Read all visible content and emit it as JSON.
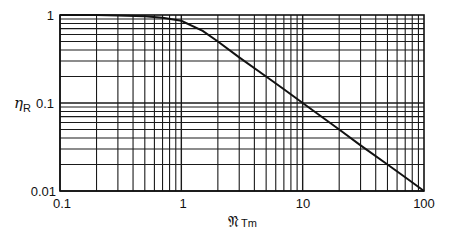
{
  "chart_data": {
    "type": "line",
    "title": "",
    "xlabel": "𝔑 Tm",
    "xlabel_main": "𝔑",
    "xlabel_sub": "Tm",
    "ylabel": "η R",
    "ylabel_main": "η",
    "ylabel_sub": "R",
    "xscale": "log",
    "yscale": "log",
    "xlim": [
      0.1,
      100
    ],
    "ylim": [
      0.01,
      1
    ],
    "x_ticks": [
      "0.1",
      "1",
      "10",
      "100"
    ],
    "y_ticks": [
      "1",
      "0.1",
      "0.01"
    ],
    "grid": true,
    "series": [
      {
        "name": "eta_R",
        "x": [
          0.1,
          0.2,
          0.3,
          0.5,
          0.7,
          1,
          1.5,
          2,
          3,
          5,
          7,
          10,
          20,
          30,
          50,
          70,
          100
        ],
        "y": [
          1.0,
          1.0,
          0.99,
          0.97,
          0.93,
          0.86,
          0.66,
          0.5,
          0.33,
          0.2,
          0.143,
          0.1,
          0.05,
          0.033,
          0.02,
          0.0143,
          0.01
        ]
      }
    ],
    "color": "#111111"
  },
  "axes": {
    "y_tick_labels": [
      "1",
      "0.1",
      "0.01"
    ],
    "x_tick_labels": [
      "0.1",
      "1",
      "10",
      "100"
    ],
    "ylabel_main": "η",
    "ylabel_sub": "R",
    "xlabel_main": "𝔑",
    "xlabel_sub": "Tm"
  }
}
